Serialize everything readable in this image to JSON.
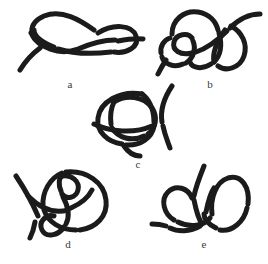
{
  "figure": {
    "background_color": "#ffffff",
    "stroke_color": "#1b1b1b",
    "width": 268,
    "height": 264,
    "panel_count": 5
  },
  "panels": [
    {
      "id": "a",
      "label": "a",
      "description": "open twisted double-loop knot with two free ends, lower-left end and right end",
      "label_x": 60,
      "label_y": 78,
      "box": {
        "x": 18,
        "y": 8,
        "w": 118,
        "h": 62
      },
      "stroke_width": 5.0,
      "free_ends": 2,
      "crossings": 4
    },
    {
      "id": "b",
      "label": "b",
      "description": "double-lobed knot resembling joined loops with end exiting upper right and lower left",
      "label_x": 200,
      "label_y": 78,
      "box": {
        "x": 152,
        "y": 6,
        "w": 112,
        "h": 68
      },
      "stroke_width": 5.0,
      "free_ends": 2,
      "crossings": 5
    },
    {
      "id": "c",
      "label": "c",
      "description": "rounded triple-loop knot with a single strand crossing down the right side",
      "label_x": 128,
      "label_y": 158,
      "box": {
        "x": 88,
        "y": 88,
        "w": 96,
        "h": 66
      },
      "stroke_width": 5.0,
      "free_ends": 2,
      "crossings": 5
    },
    {
      "id": "d",
      "label": "d",
      "description": "large round loop with inner figure-eight and a straight strand through the left",
      "label_x": 58,
      "label_y": 238,
      "box": {
        "x": 12,
        "y": 168,
        "w": 108,
        "h": 72
      },
      "stroke_width": 5.0,
      "free_ends": 2,
      "crossings": 6
    },
    {
      "id": "e",
      "label": "e",
      "description": "two tall adjacent loops with an end rising at top and an end exiting left",
      "label_x": 194,
      "label_y": 238,
      "box": {
        "x": 150,
        "y": 166,
        "w": 108,
        "h": 74
      },
      "stroke_width": 5.0,
      "free_ends": 2,
      "crossings": 4
    }
  ]
}
